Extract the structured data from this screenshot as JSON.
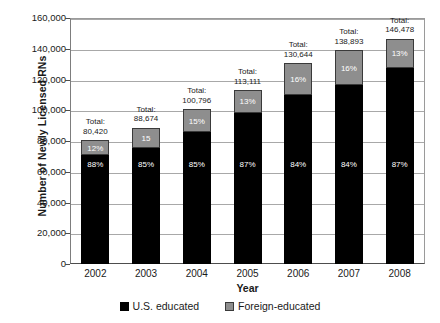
{
  "chart_data": {
    "type": "bar",
    "subtype": "stacked-bar",
    "title": "",
    "xlabel": "Year",
    "ylabel": "Number of Newly Licensed RNs",
    "categories": [
      "2002",
      "2003",
      "2004",
      "2005",
      "2006",
      "2007",
      "2008"
    ],
    "ylim": [
      0,
      160000
    ],
    "ytick_labels": [
      "0",
      "20,000",
      "40,000",
      "60,000",
      "80,000",
      "100,000",
      "120,000",
      "140,000",
      "160,000"
    ],
    "ytick_values": [
      0,
      20000,
      40000,
      60000,
      80000,
      100000,
      120000,
      140000,
      160000
    ],
    "grid": "horizontal",
    "legend_position": "bottom",
    "series": [
      {
        "name": "U.S. educated",
        "color": "#000000",
        "values": [
          70770,
          75373,
          85677,
          98407,
          109741,
          116670,
          127436
        ],
        "percent_labels": [
          "88%",
          "85%",
          "85%",
          "87%",
          "84%",
          "84%",
          "87%"
        ]
      },
      {
        "name": "Foreign-educated",
        "color": "#8e8e8e",
        "values": [
          9650,
          13301,
          15119,
          14704,
          20903,
          22223,
          19042
        ],
        "percent_labels": [
          "12%",
          "15",
          "15%",
          "13%",
          "16%",
          "16%",
          "13%"
        ]
      }
    ],
    "totals": [
      80420,
      88674,
      100796,
      113111,
      130644,
      138893,
      146478
    ],
    "total_labels": [
      "Total:\n80,420",
      "Total:\n88,674",
      "Total:\n100,796",
      "Total:\n113,111",
      "Total:\n130,644",
      "Total:\n138,893",
      "Total:\n146,478"
    ]
  },
  "legend": {
    "items": [
      {
        "label": "U.S. educated",
        "color": "#000000",
        "swatch": "us"
      },
      {
        "label": "Foreign-educated",
        "color": "#8e8e8e",
        "swatch": "foreign"
      }
    ]
  }
}
